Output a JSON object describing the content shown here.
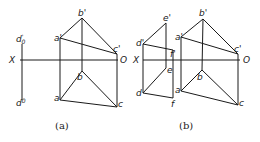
{
  "figures": [
    {
      "id": "a",
      "caption": "(a)",
      "axis": {
        "x_label": "X",
        "o_label": "O",
        "x1": 20,
        "x2": 118,
        "y": 60
      },
      "points": {
        "a_prime": {
          "label": "a'",
          "x": 60,
          "y": 38
        },
        "b_prime": {
          "label": "b'",
          "x": 82,
          "y": 18
        },
        "c_prime": {
          "label": "c'",
          "x": 117,
          "y": 54
        },
        "a": {
          "label": "a",
          "x": 60,
          "y": 100
        },
        "b": {
          "label": "b",
          "x": 82,
          "y": 71
        },
        "c": {
          "label": "c",
          "x": 117,
          "y": 107
        }
      },
      "extra_line": {
        "top_label": "d0'",
        "bottom_label": "d0",
        "x": 22,
        "y1": 44,
        "y2": 100
      }
    },
    {
      "id": "b",
      "caption": "(b)",
      "axis": {
        "x_label": "X",
        "o_label": "O",
        "x1": 143,
        "x2": 240,
        "y": 60
      },
      "points": {
        "a_prime": {
          "label": "a'",
          "x": 181,
          "y": 37
        },
        "b_prime": {
          "label": "b'",
          "x": 203,
          "y": 19
        },
        "c_prime": {
          "label": "c'",
          "x": 238,
          "y": 54
        },
        "a": {
          "label": "a",
          "x": 181,
          "y": 91
        },
        "b": {
          "label": "b",
          "x": 202,
          "y": 70
        },
        "c": {
          "label": "c",
          "x": 238,
          "y": 105
        },
        "d_prime": {
          "label": "d'",
          "x": 143,
          "y": 44
        },
        "e_prime": {
          "label": "e'",
          "x": 166,
          "y": 23
        },
        "f_prime": {
          "label": "f'",
          "x": 173,
          "y": 50
        },
        "d": {
          "label": "d",
          "x": 143,
          "y": 93
        },
        "e": {
          "label": "e",
          "x": 166,
          "y": 68
        },
        "f": {
          "label": "f",
          "x": 173,
          "y": 98
        }
      }
    }
  ],
  "labels": {
    "a_caption": "(a)",
    "b_caption": "(b)",
    "x": "X",
    "o": "O",
    "a_prime": "a'",
    "b_prime": "b'",
    "c_prime": "c'",
    "a": "a",
    "b": "b",
    "c": "c",
    "d_prime": "d'",
    "e_prime": "e'",
    "f_prime": "f'",
    "d": "d",
    "e": "e",
    "f": "f",
    "d0_prime_main": "d",
    "d0_prime_sup": "'",
    "d0_sub": "0",
    "d0_main": "d"
  }
}
